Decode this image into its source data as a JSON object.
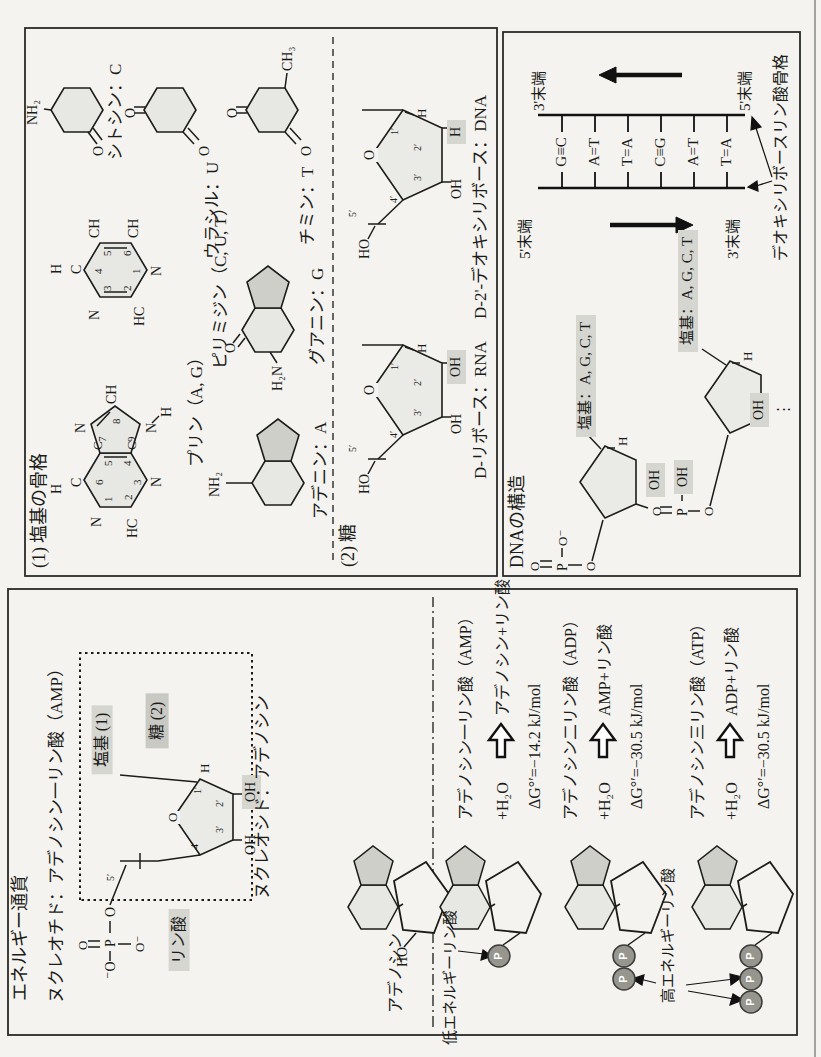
{
  "page": {
    "width": 821,
    "height": 1057,
    "orientation": "rotated-90-ccw",
    "background": "#f4f3ef"
  },
  "colors": {
    "ink": "#1b1b19",
    "ring_fill": "#e7e7e3",
    "ring_fill_dark": "#cfcfca",
    "sugar_fill": "#eaeae6",
    "highlight": "#d6d6d1",
    "highlight_dark": "#c9c9c4",
    "p_circle": "#96968f",
    "page_rule": "#777"
  },
  "boxA": {
    "heading": "(1) 塩基の骨格",
    "pyrimidine_skeleton": {
      "label": "ピリミジン（C, U, T）",
      "atoms": [
        "H",
        "C",
        "CH",
        "CH",
        "N",
        "HC",
        "N"
      ],
      "numbers": [
        "1",
        "2",
        "3",
        "4",
        "5",
        "6"
      ]
    },
    "purine_skeleton": {
      "label": "プリン（A, G）",
      "atoms": [
        "H",
        "C",
        "N",
        "HC",
        "N",
        "C",
        "C",
        "N",
        "CH",
        "N",
        "H"
      ],
      "numbers": [
        "1",
        "2",
        "3",
        "4",
        "5",
        "6",
        "7",
        "8",
        "9"
      ]
    },
    "adenine": {
      "label": "アデニン：A",
      "amine": "NH₂"
    },
    "guanine": {
      "label": "グアニン：G",
      "amine": "H₂N",
      "oxo": "O"
    },
    "cytosine": {
      "label": "シトシン：C",
      "amine": "NH₂",
      "oxo": "O"
    },
    "uracil": {
      "label": "ウラシル：U",
      "oxo_top": "O",
      "oxo_bottom": "O"
    },
    "thymine": {
      "label": "チミン：T",
      "oxo_top": "O",
      "oxo_bottom": "O",
      "methyl": "CH₃"
    },
    "sugar_heading": "(2) 糖",
    "ribose": {
      "label": "D-リボース：RNA",
      "ring_o": "O",
      "ho": "HO",
      "h1": "H",
      "oh2": "OH",
      "oh3": "OH",
      "numbers": [
        "1′",
        "2′",
        "3′",
        "4′",
        "5′"
      ]
    },
    "deoxyribose": {
      "label": "D-2'-デオキシリボース：DNA",
      "ring_o": "O",
      "ho": "HO",
      "h1": "H",
      "h2_highlight": "H",
      "oh3": "OH",
      "numbers": [
        "1′",
        "2′",
        "3′",
        "4′",
        "5′"
      ]
    }
  },
  "boxB": {
    "heading": "DNAの構造",
    "ladder": {
      "top_left_end": "5'末端",
      "top_right_end": "3'末端",
      "bottom_left_end": "3'末端",
      "bottom_right_end": "5'末端",
      "base_pairs": [
        "G≡C",
        "A=T",
        "T=A",
        "C≡G",
        "A=T",
        "T=A"
      ],
      "backbone_label": "デオキシリボースリン酸骨格"
    },
    "strand": {
      "base_label_1": "塩基：A, G, C, T",
      "base_label_2": "塩基：A, G, C, T",
      "h1": "H",
      "h2": "H",
      "oh_upper": "OH",
      "oh_lower": "OH",
      "continuation": "⋮",
      "phosphate_top": [
        "O",
        "P",
        "O⁻",
        "O"
      ],
      "phosphate_mid": [
        "O",
        "P",
        "OH",
        "O"
      ]
    }
  },
  "energyBox": {
    "title": "エネルギー通貨",
    "nucleotide_title": "ヌクレオチド：アデノシン一リン酸（AMP）",
    "nucleoside_label": "ヌクレオシド：アデノシン",
    "base_tag": "塩基 (1)",
    "sugar_tag": "糖 (2)",
    "phosphate_tag": "リン酸",
    "sugar": {
      "ring_o": "O",
      "h1": "H",
      "oh2": "OH",
      "oh3": "OH",
      "numbers": [
        "1′",
        "2′",
        "3′",
        "4′",
        "5′"
      ]
    },
    "phosphate_atoms": [
      "⁻O",
      "P",
      "O",
      "O",
      "O⁻"
    ],
    "adenosine_label": "アデノシン",
    "adenosine_ho": "HO",
    "low_energy_label": "低エネルギーリン酸",
    "high_energy_label": "高エネルギーリン酸",
    "p_symbol": "P",
    "reactions": [
      {
        "name": "アデノシン一リン酸（AMP）",
        "reactant": "+H₂O",
        "product": "アデノシン+リン酸",
        "dg": "ΔG°′=−14.2 kJ/mol"
      },
      {
        "name": "アデノシン二リン酸（ADP）",
        "reactant": "+H₂O",
        "product": "AMP+リン酸",
        "dg": "ΔG°′=−30.5 kJ/mol"
      },
      {
        "name": "アデノシン三リン酸（ATP）",
        "reactant": "+H₂O",
        "product": "ADP+リン酸",
        "dg": "ΔG°′=−30.5 kJ/mol"
      }
    ]
  },
  "placements": [
    {
      "n": "section1-heading",
      "t": "(1) 塩基の骨格",
      "x": 489,
      "y": 30,
      "fs": 18
    },
    {
      "n": "pyrimidine-h4",
      "t": "H",
      "x": 783,
      "y": 50,
      "fs": 14
    },
    {
      "n": "pyrimidine-c4",
      "t": "C",
      "x": 783,
      "y": 70,
      "fs": 14
    },
    {
      "n": "pyrimidine-ch5",
      "t": "CH",
      "x": 819,
      "y": 88,
      "fs": 14
    },
    {
      "n": "pyrimidine-ch6",
      "t": "CH",
      "x": 819,
      "y": 127,
      "fs": 14
    },
    {
      "n": "pyrimidine-n1",
      "t": "N",
      "x": 781,
      "y": 150,
      "fs": 14
    },
    {
      "n": "pyrimidine-hc2",
      "t": "HC",
      "x": 731,
      "y": 133,
      "fs": 14
    },
    {
      "n": "pyrimidine-n3",
      "t": "N",
      "x": 737,
      "y": 88,
      "fs": 14
    },
    {
      "n": "pyrimidine-no4",
      "t": "4",
      "x": 783,
      "y": 93,
      "fs": 11
    },
    {
      "n": "pyrimidine-no5",
      "t": "5",
      "x": 801,
      "y": 102,
      "fs": 11
    },
    {
      "n": "pyrimidine-no6",
      "t": "6",
      "x": 801,
      "y": 122,
      "fs": 11
    },
    {
      "n": "pyrimidine-no1",
      "t": "1",
      "x": 783,
      "y": 131,
      "fs": 11
    },
    {
      "n": "pyrimidine-no2",
      "t": "2",
      "x": 766,
      "y": 122,
      "fs": 11
    },
    {
      "n": "pyrimidine-no3",
      "t": "3",
      "x": 766,
      "y": 102,
      "fs": 11
    },
    {
      "n": "pyrimidine-label",
      "t": "ピリミジン（C, U, T）",
      "x": 688,
      "y": 212,
      "fs": 17
    },
    {
      "n": "purine-h6",
      "t": "H",
      "x": 563,
      "y": 50,
      "fs": 14
    },
    {
      "n": "purine-c6",
      "t": "C",
      "x": 570,
      "y": 70,
      "fs": 14
    },
    {
      "n": "purine-n1",
      "t": "N",
      "x": 530,
      "y": 90,
      "fs": 14
    },
    {
      "n": "purine-hc2",
      "t": "HC",
      "x": 519,
      "y": 126,
      "fs": 14
    },
    {
      "n": "purine-n3",
      "t": "N",
      "x": 570,
      "y": 150,
      "fs": 14
    },
    {
      "n": "purine-c5",
      "t": "C",
      "x": 607,
      "y": 91,
      "fs": 13
    },
    {
      "n": "purine-c4",
      "t": "C",
      "x": 607,
      "y": 125,
      "fs": 13
    },
    {
      "n": "purine-n7",
      "t": "N",
      "x": 624,
      "y": 74,
      "fs": 14
    },
    {
      "n": "purine-ch8",
      "t": "CH",
      "x": 653,
      "y": 105,
      "fs": 14
    },
    {
      "n": "purine-n9",
      "t": "N",
      "x": 624,
      "y": 145,
      "fs": 14
    },
    {
      "n": "purine-h9",
      "t": "H",
      "x": 640,
      "y": 160,
      "fs": 14
    },
    {
      "n": "purine-no6",
      "t": "6",
      "x": 572,
      "y": 94,
      "fs": 11
    },
    {
      "n": "purine-no1",
      "t": "1",
      "x": 555,
      "y": 103,
      "fs": 11
    },
    {
      "n": "purine-no5",
      "t": "5",
      "x": 591,
      "y": 103,
      "fs": 11
    },
    {
      "n": "purine-no2",
      "t": "2",
      "x": 557,
      "y": 123,
      "fs": 11
    },
    {
      "n": "purine-no4",
      "t": "4",
      "x": 591,
      "y": 122,
      "fs": 11
    },
    {
      "n": "purine-no3",
      "t": "3",
      "x": 572,
      "y": 132,
      "fs": 11
    },
    {
      "n": "purine-no7",
      "t": "7",
      "x": 615,
      "y": 97,
      "fs": 11
    },
    {
      "n": "purine-no8",
      "t": "8",
      "x": 633,
      "y": 111,
      "fs": 11
    },
    {
      "n": "purine-no9",
      "t": "9",
      "x": 615,
      "y": 126,
      "fs": 11
    },
    {
      "n": "purine-label",
      "t": "プリン（A, G）",
      "x": 590,
      "y": 188,
      "fs": 17
    },
    {
      "n": "adenine-amine",
      "t": "NH₂",
      "x": 560,
      "y": 208,
      "fs": 14
    },
    {
      "n": "adenine-label",
      "t": "アデニン：A",
      "x": 538,
      "y": 312,
      "fs": 17
    },
    {
      "n": "guanine-oxo",
      "t": "O",
      "x": 704,
      "y": 224,
      "fs": 14
    },
    {
      "n": "guanine-amine",
      "t": "H₂N",
      "x": 666,
      "y": 271,
      "fs": 14
    },
    {
      "n": "guanine-label",
      "t": "グアニン：G",
      "x": 692,
      "y": 309,
      "fs": 17
    },
    {
      "n": "cytosine-amine",
      "t": "NH₂",
      "x": 932,
      "y": 26,
      "fs": 14
    },
    {
      "n": "cytosine-oxo",
      "t": "O",
      "x": 901,
      "y": 92,
      "fs": 14
    },
    {
      "n": "cytosine-label",
      "t": "シトシン：C",
      "x": 897,
      "y": 107,
      "fs": 17
    },
    {
      "n": "uracil-oxo-top",
      "t": "O",
      "x": 939,
      "y": 124,
      "fs": 14
    },
    {
      "n": "uracil-oxo-bottom",
      "t": "O",
      "x": 901,
      "y": 198,
      "fs": 14
    },
    {
      "n": "uracil-label",
      "t": "ウラシル：U",
      "x": 798,
      "y": 204,
      "fs": 17
    },
    {
      "n": "thymine-oxo-top",
      "t": "O",
      "x": 939,
      "y": 226,
      "fs": 14
    },
    {
      "n": "thymine-oxo-bottom",
      "t": "O",
      "x": 901,
      "y": 300,
      "fs": 14
    },
    {
      "n": "thymine-methyl",
      "t": "CH₃",
      "x": 986,
      "y": 281,
      "fs": 14
    },
    {
      "n": "thymine-label",
      "t": "チミン：T",
      "x": 812,
      "y": 299,
      "fs": 17
    },
    {
      "n": "section2-heading",
      "t": "(2) 糖",
      "x": 490,
      "y": 339,
      "fs": 18
    },
    {
      "n": "ribose-ring-o",
      "t": "O",
      "x": 660,
      "y": 363,
      "fs": 14,
      "cls": "bgp"
    },
    {
      "n": "ribose-ho",
      "t": "HO",
      "x": 563,
      "y": 358,
      "fs": 14
    },
    {
      "n": "ribose-h1",
      "t": "H",
      "x": 704,
      "y": 415,
      "fs": 13
    },
    {
      "n": "ribose-oh2",
      "t": "OH",
      "x": 673,
      "y": 447,
      "fs": 14,
      "cls": "hl"
    },
    {
      "n": "ribose-oh3",
      "t": "OH",
      "x": 623,
      "y": 450,
      "fs": 14
    },
    {
      "n": "ribose-5",
      "t": "5′",
      "x": 605,
      "y": 348,
      "fs": 10
    },
    {
      "n": "ribose-4",
      "t": "4′",
      "x": 619,
      "y": 389,
      "fs": 10
    },
    {
      "n": "ribose-3",
      "t": "3′",
      "x": 641,
      "y": 413,
      "fs": 10
    },
    {
      "n": "ribose-2",
      "t": "2′",
      "x": 671,
      "y": 413,
      "fs": 10
    },
    {
      "n": "ribose-1",
      "t": "1′",
      "x": 687,
      "y": 390,
      "fs": 10
    },
    {
      "n": "ribose-label",
      "t": "D-リボース：RNA",
      "x": 578,
      "y": 472,
      "fs": 17
    },
    {
      "n": "deoxyribose-ring-o",
      "t": "O",
      "x": 895,
      "y": 363,
      "fs": 14,
      "cls": "bgp"
    },
    {
      "n": "deoxyribose-ho",
      "t": "HO",
      "x": 798,
      "y": 358,
      "fs": 14
    },
    {
      "n": "deoxyribose-h1",
      "t": "H",
      "x": 939,
      "y": 415,
      "fs": 13
    },
    {
      "n": "deoxyribose-h2",
      "t": "H",
      "x": 913,
      "y": 447,
      "fs": 14,
      "cls": "hl"
    },
    {
      "n": "deoxyribose-oh3",
      "t": "OH",
      "x": 858,
      "y": 450,
      "fs": 14
    },
    {
      "n": "deoxyribose-5",
      "t": "5′",
      "x": 840,
      "y": 348,
      "fs": 10
    },
    {
      "n": "deoxyribose-4",
      "t": "4′",
      "x": 854,
      "y": 389,
      "fs": 10
    },
    {
      "n": "deoxyribose-3",
      "t": "3′",
      "x": 876,
      "y": 413,
      "fs": 10
    },
    {
      "n": "deoxyribose-2",
      "t": "2′",
      "x": 906,
      "y": 413,
      "fs": 10
    },
    {
      "n": "deoxyribose-1",
      "t": "1′",
      "x": 922,
      "y": 390,
      "fs": 10
    },
    {
      "n": "deoxyribose-label",
      "t": "D-2'-デオキシリボース：DNA",
      "x": 738,
      "y": 472,
      "fs": 17
    },
    {
      "n": "dna-heading",
      "t": "DNAの構造",
      "x": 489,
      "y": 508,
      "fs": 18
    },
    {
      "n": "ladder-end-5-top",
      "t": "5'末端",
      "x": 798,
      "y": 518,
      "fs": 15
    },
    {
      "n": "ladder-end-3-top",
      "t": "3'末端",
      "x": 946,
      "y": 532,
      "fs": 15
    },
    {
      "n": "ladder-end-3-bottom",
      "t": "3'末端",
      "x": 798,
      "y": 726,
      "fs": 15
    },
    {
      "n": "ladder-end-5-bottom",
      "t": "5'末端",
      "x": 946,
      "y": 738,
      "fs": 15
    },
    {
      "n": "bp-1",
      "t": "G≡C",
      "x": 905,
      "y": 562,
      "fs": 15,
      "cls": "c"
    },
    {
      "n": "bp-2",
      "t": "A=T",
      "x": 905,
      "y": 595,
      "fs": 15,
      "cls": "c"
    },
    {
      "n": "bp-3",
      "t": "T=A",
      "x": 905,
      "y": 628,
      "fs": 15,
      "cls": "c"
    },
    {
      "n": "bp-4",
      "t": "C≡G",
      "x": 905,
      "y": 661,
      "fs": 15,
      "cls": "c"
    },
    {
      "n": "bp-5",
      "t": "A=T",
      "x": 905,
      "y": 694,
      "fs": 15,
      "cls": "c"
    },
    {
      "n": "bp-6",
      "t": "T=A",
      "x": 905,
      "y": 727,
      "fs": 15,
      "cls": "c"
    },
    {
      "n": "backbone-label",
      "t": "デオキシリボースリン酸骨格",
      "x": 796,
      "y": 773,
      "fs": 16
    },
    {
      "n": "strand-base-2",
      "t": "塩基：A, G, C, T",
      "x": 620,
      "y": 576,
      "fs": 15,
      "cls": "hl"
    },
    {
      "n": "strand-base-1",
      "t": "塩基：A, G, C, T",
      "x": 705,
      "y": 678,
      "fs": 15,
      "cls": "hl"
    },
    {
      "n": "strand-h2",
      "t": "H",
      "x": 611,
      "y": 616,
      "fs": 13
    },
    {
      "n": "strand-h1",
      "t": "H",
      "x": 696,
      "y": 741,
      "fs": 13
    },
    {
      "n": "strand-oh-upper",
      "t": "OH",
      "x": 560,
      "y": 646,
      "fs": 14,
      "cls": "hl"
    },
    {
      "n": "strand-oh-lower",
      "t": "OH",
      "x": 630,
      "y": 750,
      "fs": 14,
      "cls": "hl"
    },
    {
      "n": "strand-dots",
      "t": "⋮",
      "x": 640,
      "y": 776,
      "fs": 15
    },
    {
      "n": "phos1-o-top",
      "t": "O",
      "x": 486,
      "y": 528,
      "fs": 13
    },
    {
      "n": "phos1-p",
      "t": "P",
      "x": 486,
      "y": 556,
      "fs": 14
    },
    {
      "n": "phos1-o-minus",
      "t": "O⁻",
      "x": 511,
      "y": 556,
      "fs": 13
    },
    {
      "n": "phos1-o-bottom",
      "t": "O",
      "x": 486,
      "y": 584,
      "fs": 13
    },
    {
      "n": "phos2-o-top",
      "t": "O",
      "x": 541,
      "y": 650,
      "fs": 13
    },
    {
      "n": "phos2-p",
      "t": "P",
      "x": 541,
      "y": 676,
      "fs": 14
    },
    {
      "n": "phos2-oh",
      "t": "OH",
      "x": 563,
      "y": 674,
      "fs": 14,
      "cls": "hl"
    },
    {
      "n": "phos2-o-bottom",
      "t": "O",
      "x": 541,
      "y": 702,
      "fs": 13
    },
    {
      "n": "energy-title",
      "t": "エネルギー通貨",
      "x": 56,
      "y": 11,
      "fs": 18
    },
    {
      "n": "nucleotide-title",
      "t": "ヌクレオチド：アデノシン一リン酸（AMP）",
      "x": 54,
      "y": 48,
      "fs": 17
    },
    {
      "n": "base-tag",
      "t": "塩基 (1)",
      "x": 317,
      "y": 102,
      "fs": 16,
      "cls": "c hl"
    },
    {
      "n": "sugar-tag",
      "t": "糖 (2)",
      "x": 336,
      "y": 157,
      "fs": 16,
      "cls": "c hl2"
    },
    {
      "n": "phosphate-tag",
      "t": "リン酸",
      "x": 117,
      "y": 179,
      "fs": 16,
      "cls": "c hl"
    },
    {
      "n": "amp-ring-o",
      "t": "O",
      "x": 233,
      "y": 166,
      "fs": 13,
      "cls": "bgp"
    },
    {
      "n": "amp-h1",
      "t": "H",
      "x": 284,
      "y": 198,
      "fs": 13
    },
    {
      "n": "amp-oh2",
      "t": "OH",
      "x": 248,
      "y": 242,
      "fs": 14,
      "cls": "hl"
    },
    {
      "n": "amp-oh3",
      "t": "OH",
      "x": 202,
      "y": 244,
      "fs": 14
    },
    {
      "n": "amp-1",
      "t": "1′",
      "x": 263,
      "y": 193,
      "fs": 10
    },
    {
      "n": "amp-2",
      "t": "2′",
      "x": 250,
      "y": 215,
      "fs": 10
    },
    {
      "n": "amp-3",
      "t": "3′",
      "x": 224,
      "y": 215,
      "fs": 10
    },
    {
      "n": "amp-4",
      "t": "4′",
      "x": 208,
      "y": 190,
      "fs": 10
    },
    {
      "n": "amp-5",
      "t": "5′",
      "x": 176,
      "y": 106,
      "fs": 10
    },
    {
      "n": "amp-phos-ominus-left",
      "t": "⁻O",
      "x": 78,
      "y": 104,
      "fs": 14
    },
    {
      "n": "amp-phos-p",
      "t": "P",
      "x": 110,
      "y": 104,
      "fs": 14
    },
    {
      "n": "amp-phos-o-ester",
      "t": "O",
      "x": 140,
      "y": 104,
      "fs": 14
    },
    {
      "n": "amp-phos-o-double",
      "t": "O",
      "x": 107,
      "y": 76,
      "fs": 13
    },
    {
      "n": "amp-phos-ominus-down",
      "t": "O⁻",
      "x": 105,
      "y": 133,
      "fs": 13
    },
    {
      "n": "nucleoside-label",
      "t": "ヌクレオシド：アデノシン",
      "x": 158,
      "y": 254,
      "fs": 17
    },
    {
      "n": "adenosine-label",
      "t": "アデノシン",
      "x": 44,
      "y": 388,
      "fs": 16
    },
    {
      "n": "adenosine-ho",
      "t": "HO",
      "x": 90,
      "y": 396,
      "fs": 14
    },
    {
      "n": "low-energy-label",
      "t": "低エネルギーリン酸",
      "x": 12,
      "y": 443,
      "fs": 15
    },
    {
      "n": "high-energy-label",
      "t": "高エネルギーリン酸",
      "x": 54,
      "y": 661,
      "fs": 15
    },
    {
      "n": "amp-reaction-name",
      "t": "アデノシン一リン酸（AMP）",
      "x": 237,
      "y": 458,
      "fs": 16
    },
    {
      "n": "amp-reaction-water",
      "t": "+H₂O",
      "x": 237,
      "y": 495,
      "fs": 16
    },
    {
      "n": "amp-reaction-product",
      "t": "アデノシン+リン酸",
      "x": 341,
      "y": 495,
      "fs": 16
    },
    {
      "n": "amp-reaction-dg",
      "t": "ΔG°′=−14.2 kJ/mol",
      "x": 248,
      "y": 527,
      "fs": 16
    },
    {
      "n": "adp-reaction-name",
      "t": "アデノシン二リン酸（ADP）",
      "x": 237,
      "y": 563,
      "fs": 16
    },
    {
      "n": "adp-reaction-water",
      "t": "+H₂O",
      "x": 237,
      "y": 597,
      "fs": 16
    },
    {
      "n": "adp-reaction-product",
      "t": "AMP+リン酸",
      "x": 341,
      "y": 597,
      "fs": 16
    },
    {
      "n": "adp-reaction-dg",
      "t": "ΔG°′=−30.5 kJ/mol",
      "x": 248,
      "y": 629,
      "fs": 16
    },
    {
      "n": "atp-reaction-name",
      "t": "アデノシン三リン酸（ATP）",
      "x": 237,
      "y": 690,
      "fs": 16
    },
    {
      "n": "atp-reaction-water",
      "t": "+H₂O",
      "x": 237,
      "y": 724,
      "fs": 16
    },
    {
      "n": "atp-reaction-product",
      "t": "ADP+リン酸",
      "x": 341,
      "y": 724,
      "fs": 16
    },
    {
      "n": "atp-reaction-dg",
      "t": "ΔG°′=−30.5 kJ/mol",
      "x": 248,
      "y": 756,
      "fs": 16
    },
    {
      "n": "p-amp-1",
      "t": "P",
      "x": 101,
      "y": 499,
      "fs": 11,
      "cls": "c pw"
    },
    {
      "n": "p-adp-1",
      "t": "P",
      "x": 101,
      "y": 624,
      "fs": 11,
      "cls": "c pw"
    },
    {
      "n": "p-adp-2",
      "t": "P",
      "x": 78,
      "y": 624,
      "fs": 11,
      "cls": "c pw"
    },
    {
      "n": "p-atp-1",
      "t": "P",
      "x": 101,
      "y": 751,
      "fs": 11,
      "cls": "c pw"
    },
    {
      "n": "p-atp-2",
      "t": "P",
      "x": 78,
      "y": 751,
      "fs": 11,
      "cls": "c pw"
    },
    {
      "n": "p-atp-3",
      "t": "P",
      "x": 55,
      "y": 751,
      "fs": 11,
      "cls": "c pw"
    }
  ]
}
